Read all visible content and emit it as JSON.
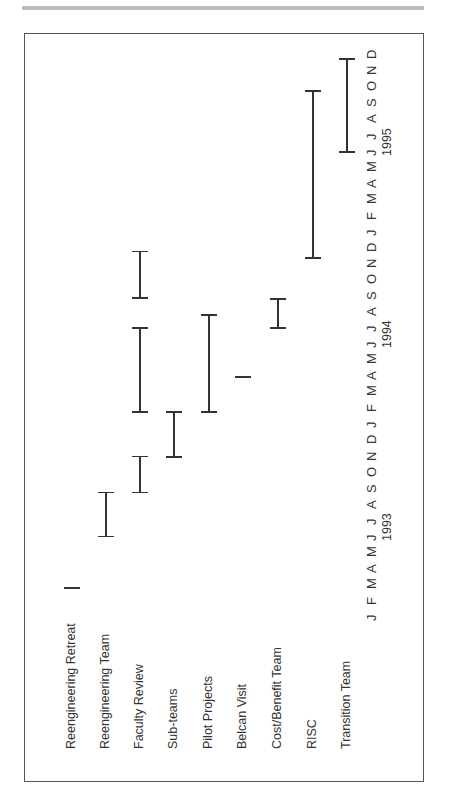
{
  "page": {
    "header_rule_color": "#bdbdbd",
    "frame_color": "#555555"
  },
  "chart_data": {
    "type": "gantt",
    "orientation": "rotated -90deg (time axis runs bottom-to-top, tasks left-to-right)",
    "title": "",
    "xlabel": "",
    "ylabel": "",
    "tasks": [
      "Reengineering Retreat",
      "Reengineering Team",
      "Faculty Review",
      "Sub-teams",
      "Pilot Projects",
      "Belcan  Visit",
      "Cost/Benefit Team",
      "RISC",
      "Transition Team"
    ],
    "time_axis": {
      "months": [
        "J",
        "F",
        "M",
        "A",
        "M",
        "J",
        "J",
        "A",
        "S",
        "O",
        "N",
        "D",
        "J",
        "F",
        "M",
        "A",
        "M",
        "J",
        "J",
        "A",
        "S",
        "O",
        "N",
        "D",
        "J",
        "F",
        "M",
        "A",
        "M",
        "J",
        "J",
        "A",
        "S",
        "O",
        "N",
        "D"
      ],
      "years": [
        {
          "label": "1993",
          "center_month_index": 5.5
        },
        {
          "label": "1994",
          "center_month_index": 17.5
        },
        {
          "label": "1995",
          "center_month_index": 29.5
        }
      ],
      "range": [
        "Jan 1993",
        "Dec 1995"
      ]
    },
    "series": [
      {
        "name": "Reengineering Retreat",
        "segments": [
          {
            "start": "Mar 1993",
            "end": "Mar 1993",
            "start_idx": 1.75,
            "end_idx": 1.75,
            "milestone": true
          }
        ]
      },
      {
        "name": "Reengineering Team",
        "segments": [
          {
            "start": "Jun 1993",
            "end": "Sep 1993",
            "start_idx": 4.95,
            "end_idx": 7.7
          }
        ]
      },
      {
        "name": "Faculty Review",
        "segments": [
          {
            "start": "Sep 1993",
            "end": "Nov 1993",
            "start_idx": 7.7,
            "end_idx": 9.95
          },
          {
            "start": "Feb 1994",
            "end": "Jul 1994",
            "start_idx": 12.7,
            "end_idx": 17.95
          },
          {
            "start": "Sep 1994",
            "end": "Nov 1994",
            "start_idx": 19.8,
            "end_idx": 22.7
          }
        ]
      },
      {
        "name": "Sub-teams",
        "segments": [
          {
            "start": "Nov 1993",
            "end": "Feb 1994",
            "start_idx": 9.9,
            "end_idx": 12.7
          }
        ]
      },
      {
        "name": "Pilot Projects",
        "segments": [
          {
            "start": "Feb 1994",
            "end": "Aug 1994",
            "start_idx": 12.7,
            "end_idx": 18.75
          }
        ]
      },
      {
        "name": "Belcan  Visit",
        "segments": [
          {
            "start": "Apr 1994",
            "end": "Apr 1994",
            "start_idx": 14.9,
            "end_idx": 14.9,
            "milestone": true
          }
        ]
      },
      {
        "name": "Cost/Benefit Team",
        "segments": [
          {
            "start": "Jul 1994",
            "end": "Sep 1994",
            "start_idx": 17.95,
            "end_idx": 19.75
          }
        ]
      },
      {
        "name": "RISC",
        "segments": [
          {
            "start": "Dec 1994",
            "end": "Oct 1995",
            "start_idx": 22.3,
            "end_idx": 32.7
          }
        ]
      },
      {
        "name": "Transition Team",
        "segments": [
          {
            "start": "Jun 1995",
            "end": "Dec 1995",
            "start_idx": 28.9,
            "end_idx": 34.7
          }
        ]
      }
    ],
    "grid": false,
    "legend": "none"
  }
}
